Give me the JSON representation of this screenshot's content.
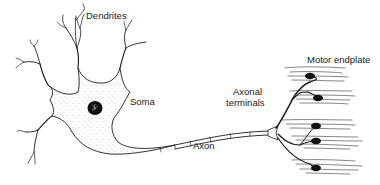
{
  "diagram": {
    "labels": {
      "dendrites": "Dendrites",
      "soma": "Soma",
      "axon": "Axon",
      "axonal_terminals_line1": "Axonal",
      "axonal_terminals_line2": "terminals",
      "motor_endplate": "Motor endplate"
    },
    "colors": {
      "line": "#1a1a1a",
      "stipple": "#9a9a9a",
      "background": "#ffffff"
    }
  }
}
